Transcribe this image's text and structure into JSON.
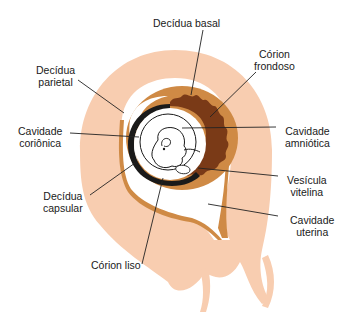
{
  "diagram": {
    "type": "anatomical illustration",
    "colors": {
      "myometrium": "#f8cdb0",
      "decidua": "#cf8a45",
      "decidua_light": "#dc9a58",
      "chorion_frondosum": "#7a3a17",
      "chorion_dark": "#1a1a1a",
      "cavity": "#ffffff",
      "line": "#222222"
    },
    "labels": {
      "decidua_basal": {
        "line1": "Decídua basal",
        "line2": ""
      },
      "corion_frondoso": {
        "line1": "Córion",
        "line2": "frondoso"
      },
      "decidua_parietal": {
        "line1": "Decídua",
        "line2": "parietal"
      },
      "cavidade_corionica": {
        "line1": "Cavidade",
        "line2": "coriônica"
      },
      "cavidade_amniotica": {
        "line1": "Cavidade",
        "line2": "amniótica"
      },
      "vesicula_vitelina": {
        "line1": "Vesícula",
        "line2": "vitelina"
      },
      "decidua_capsular": {
        "line1": "Decídua",
        "line2": "capsular"
      },
      "cavidade_uterina": {
        "line1": "Cavidade",
        "line2": "uterina"
      },
      "corion_liso": {
        "line1": "Córion liso",
        "line2": ""
      }
    }
  }
}
